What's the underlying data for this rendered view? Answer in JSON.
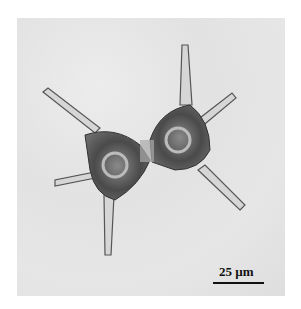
{
  "image": {
    "subject": "micrograph of a two-lobed cell with long spiny arms",
    "background_color": "#e4e4e4",
    "scale_bar": {
      "label": "25 µm",
      "color": "#111111"
    }
  }
}
